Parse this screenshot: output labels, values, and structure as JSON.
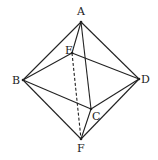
{
  "points": {
    "A": {
      "x": 81,
      "y": 22,
      "label": "A",
      "lx": 77,
      "ly": 15
    },
    "B": {
      "x": 23,
      "y": 80,
      "label": "B",
      "lx": 12,
      "ly": 84
    },
    "C": {
      "x": 91,
      "y": 109,
      "label": "C",
      "lx": 92,
      "ly": 120
    },
    "D": {
      "x": 139,
      "y": 79,
      "label": "D",
      "lx": 141,
      "ly": 83
    },
    "E": {
      "x": 72,
      "y": 53,
      "label": "E",
      "lx": 65,
      "ly": 54
    },
    "F": {
      "x": 81,
      "y": 139,
      "label": "F",
      "lx": 77,
      "ly": 152
    }
  },
  "edges": [
    {
      "from": "A",
      "to": "B",
      "style": "solid"
    },
    {
      "from": "A",
      "to": "D",
      "style": "solid"
    },
    {
      "from": "A",
      "to": "E",
      "style": "solid"
    },
    {
      "from": "A",
      "to": "C",
      "style": "solid"
    },
    {
      "from": "B",
      "to": "E",
      "style": "solid"
    },
    {
      "from": "E",
      "to": "D",
      "style": "solid"
    },
    {
      "from": "B",
      "to": "C",
      "style": "solid"
    },
    {
      "from": "C",
      "to": "D",
      "style": "solid"
    },
    {
      "from": "B",
      "to": "F",
      "style": "solid"
    },
    {
      "from": "D",
      "to": "F",
      "style": "solid"
    },
    {
      "from": "C",
      "to": "F",
      "style": "solid"
    },
    {
      "from": "E",
      "to": "F",
      "style": "dashed"
    }
  ],
  "colors": {
    "stroke": "#222222",
    "background": "#ffffff"
  }
}
